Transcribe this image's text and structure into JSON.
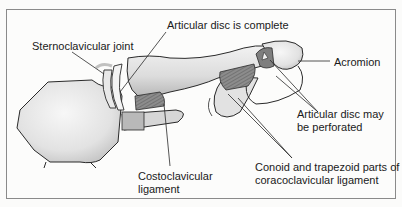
{
  "diagram": {
    "labels": {
      "sternoclavicular_joint": "Sternoclavicular joint",
      "articular_disc_complete": "Articular disc is complete",
      "acromion": "Acromion",
      "articular_disc_perforated_line1": "Articular disc may",
      "articular_disc_perforated_line2": "be perforated",
      "costoclavicular_line1": "Costoclavicular",
      "costoclavicular_line2": "ligament",
      "conoid_line1": "Conoid and trapezoid parts of",
      "conoid_line2": "coracoclavicular ligament"
    },
    "colors": {
      "bone_fill": "#e6e6e6",
      "bone_shade": "#c4c4c4",
      "ligament_hatch": "#7a7a7a",
      "outline": "#2a2a2a",
      "border": "#8a8a8a"
    }
  }
}
